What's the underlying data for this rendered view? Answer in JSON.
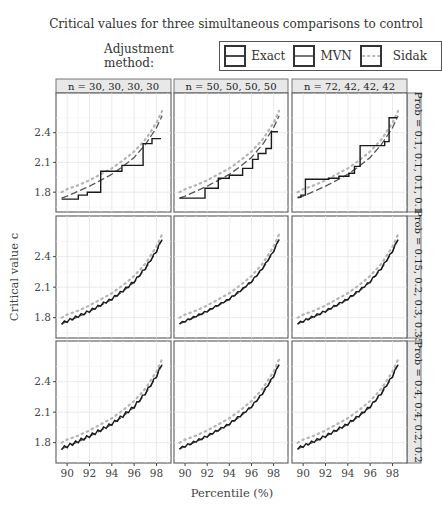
{
  "title": "Critical values for three simultaneous comparisons to control",
  "legend": {
    "label": "Adjustment method:",
    "items": [
      {
        "name": "Exact",
        "style": "solid",
        "color": "#1a1a1a"
      },
      {
        "name": "MVN",
        "style": "dashed",
        "color": "#555555"
      },
      {
        "name": "Sidak",
        "style": "dotted",
        "color": "#b8b8b8"
      }
    ]
  },
  "chart_data": {
    "type": "line",
    "title": "Critical values for three simultaneous comparisons to control",
    "xlabel": "Percentile (%)",
    "ylabel": "Critical value c",
    "xlim": [
      89,
      99.3
    ],
    "ylim": [
      1.6,
      2.8
    ],
    "xticks": [
      90,
      92,
      94,
      96,
      98
    ],
    "yticks": [
      1.8,
      2.1,
      2.4
    ],
    "grid": true,
    "column_labels": [
      "n = 30, 30, 30, 30",
      "n = 50, 50, 50, 50",
      "n = 72, 42, 42, 42"
    ],
    "row_labels": [
      "Prob = 0.1, 0.1, 0.1, 0.1",
      "Prob = 0.15, 0.2, 0.3, 0.35",
      "Prob = 0.4, 0.4, 0.2, 0.2"
    ],
    "sidak": {
      "x": [
        89.5,
        90,
        91,
        92,
        93,
        94,
        95,
        96,
        97,
        98,
        98.5
      ],
      "y": [
        1.8,
        1.83,
        1.87,
        1.92,
        1.98,
        2.04,
        2.12,
        2.21,
        2.33,
        2.5,
        2.62
      ]
    },
    "mvn": {
      "x": [
        89.5,
        90,
        91,
        92,
        93,
        94,
        95,
        96,
        97,
        98,
        98.5
      ],
      "y": [
        1.74,
        1.76,
        1.81,
        1.86,
        1.92,
        1.98,
        2.06,
        2.15,
        2.28,
        2.45,
        2.57
      ]
    },
    "panels": [
      {
        "row": 0,
        "col": 0,
        "exact_steps": [
          [
            89.5,
            1.73
          ],
          [
            91.0,
            1.73
          ],
          [
            91.0,
            1.77
          ],
          [
            91.8,
            1.77
          ],
          [
            91.8,
            1.8
          ],
          [
            93.0,
            1.8
          ],
          [
            93.0,
            2.01
          ],
          [
            94.9,
            2.01
          ],
          [
            94.9,
            2.07
          ],
          [
            96.8,
            2.07
          ],
          [
            96.8,
            2.29
          ],
          [
            97.6,
            2.29
          ],
          [
            97.6,
            2.34
          ],
          [
            98.4,
            2.34
          ]
        ]
      },
      {
        "row": 0,
        "col": 1,
        "exact_steps": [
          [
            89.5,
            1.74
          ],
          [
            91.8,
            1.74
          ],
          [
            91.8,
            1.84
          ],
          [
            93.0,
            1.84
          ],
          [
            93.0,
            1.94
          ],
          [
            94.0,
            1.94
          ],
          [
            94.0,
            1.97
          ],
          [
            95.2,
            1.97
          ],
          [
            95.2,
            2.04
          ],
          [
            96.1,
            2.04
          ],
          [
            96.1,
            2.13
          ],
          [
            96.6,
            2.13
          ],
          [
            96.6,
            2.19
          ],
          [
            97.3,
            2.19
          ],
          [
            97.3,
            2.24
          ],
          [
            97.8,
            2.24
          ],
          [
            97.8,
            2.41
          ],
          [
            98.4,
            2.41
          ]
        ]
      },
      {
        "row": 0,
        "col": 2,
        "exact_steps": [
          [
            89.5,
            1.75
          ],
          [
            89.8,
            1.75
          ],
          [
            89.8,
            1.77
          ],
          [
            90.2,
            1.77
          ],
          [
            90.2,
            1.93
          ],
          [
            92.3,
            1.93
          ],
          [
            92.3,
            1.94
          ],
          [
            93.2,
            1.94
          ],
          [
            93.2,
            1.96
          ],
          [
            94.1,
            1.96
          ],
          [
            94.1,
            1.99
          ],
          [
            94.6,
            1.99
          ],
          [
            94.6,
            2.06
          ],
          [
            95.1,
            2.06
          ],
          [
            95.1,
            2.27
          ],
          [
            97.3,
            2.27
          ],
          [
            97.3,
            2.31
          ],
          [
            97.7,
            2.31
          ],
          [
            97.7,
            2.55
          ],
          [
            98.4,
            2.55
          ]
        ]
      },
      {
        "row": 1,
        "col": 0,
        "exact_wiggle": 0.012
      },
      {
        "row": 1,
        "col": 1,
        "exact_wiggle": 0.008
      },
      {
        "row": 1,
        "col": 2,
        "exact_wiggle": 0.01
      },
      {
        "row": 2,
        "col": 0,
        "exact_wiggle": 0.015
      },
      {
        "row": 2,
        "col": 1,
        "exact_wiggle": 0.01
      },
      {
        "row": 2,
        "col": 2,
        "exact_wiggle": 0.012
      }
    ]
  }
}
